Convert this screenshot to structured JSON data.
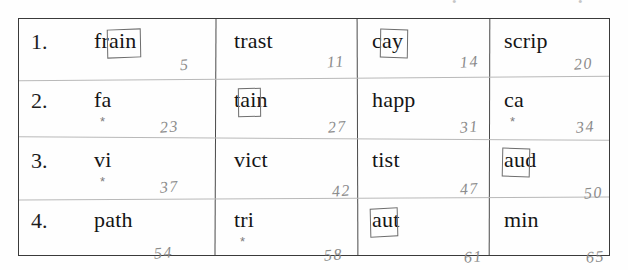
{
  "page": {
    "top_smudges": [
      "•",
      "•"
    ]
  },
  "table": {
    "row_numbers": [
      "1.",
      "2.",
      "3.",
      "4."
    ],
    "rows": [
      {
        "number": "1.",
        "cells": [
          {
            "word": "frain",
            "ring": "ain",
            "ring_start": 2,
            "ring_len": 3,
            "star": "",
            "pencil_number": "5"
          },
          {
            "word": "trast",
            "ring": "",
            "ring_start": 0,
            "ring_len": 0,
            "star": "",
            "pencil_number": "11"
          },
          {
            "word": "cay",
            "ring": "ay",
            "ring_start": 1,
            "ring_len": 2,
            "star": "",
            "pencil_number": "14"
          },
          {
            "word": "scrip",
            "ring": "",
            "ring_start": 0,
            "ring_len": 0,
            "star": "",
            "pencil_number": "20"
          }
        ]
      },
      {
        "number": "2.",
        "cells": [
          {
            "word": "fa",
            "ring": "",
            "ring_start": 0,
            "ring_len": 0,
            "star": "*",
            "pencil_number": "23"
          },
          {
            "word": "tain",
            "ring": "ai",
            "ring_start": 1,
            "ring_len": 2,
            "star": "",
            "pencil_number": "27"
          },
          {
            "word": "happ",
            "ring": "",
            "ring_start": 0,
            "ring_len": 0,
            "star": "",
            "pencil_number": "31"
          },
          {
            "word": "ca",
            "ring": "",
            "ring_start": 0,
            "ring_len": 0,
            "star": "*",
            "pencil_number": "34"
          }
        ]
      },
      {
        "number": "3.",
        "cells": [
          {
            "word": "vi",
            "ring": "",
            "ring_start": 0,
            "ring_len": 0,
            "star": "*",
            "pencil_number": "37"
          },
          {
            "word": "vict",
            "ring": "",
            "ring_start": 0,
            "ring_len": 0,
            "star": "",
            "pencil_number": "42"
          },
          {
            "word": "tist",
            "ring": "",
            "ring_start": 0,
            "ring_len": 0,
            "star": "",
            "pencil_number": "47"
          },
          {
            "word": "aud",
            "ring": "au",
            "ring_start": 0,
            "ring_len": 2,
            "star": "",
            "pencil_number": "50"
          }
        ]
      },
      {
        "number": "4.",
        "cells": [
          {
            "word": "path",
            "ring": "",
            "ring_start": 0,
            "ring_len": 0,
            "star": "",
            "pencil_number": "54"
          },
          {
            "word": "tri",
            "ring": "",
            "ring_start": 0,
            "ring_len": 0,
            "star": "*",
            "pencil_number": "58"
          },
          {
            "word": "aut",
            "ring": "au",
            "ring_start": 0,
            "ring_len": 2,
            "star": "",
            "pencil_number": "61"
          },
          {
            "word": "min",
            "ring": "",
            "ring_start": 0,
            "ring_len": 0,
            "star": "",
            "pencil_number": "65"
          }
        ]
      }
    ]
  },
  "colors": {
    "paper": "#fefefe",
    "print_ink": "#151515",
    "frame": "#3a3a3a",
    "pencil": "#8b8b8b",
    "pencil_rule": "#b9b9b9",
    "ring": "#6d6d6d"
  }
}
